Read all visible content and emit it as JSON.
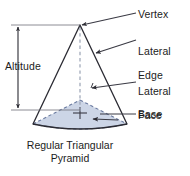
{
  "figure": {
    "caption_line1": "Regular Triangular",
    "caption_line2": "Pyramid",
    "caption_full": "Regular Triangular Pyramid"
  },
  "labels": {
    "vertex": "Vertex",
    "lateral_edge_line1": "Lateral",
    "lateral_edge_line2": "Edge",
    "lateral_face_line1": "Lateral",
    "lateral_face_line2": "Face",
    "base": "Base",
    "altitude": "Altitude"
  },
  "colors": {
    "outline": "#2b2b33",
    "leader": "#3a3a44",
    "base_fill": "#ccd5e6",
    "base_dash": "#6b7ba0",
    "altitude_dash": "#9aa3b5",
    "background": "#ffffff",
    "text": "#1c1c1c"
  },
  "geometry": {
    "apex": [
      80,
      25
    ],
    "base_left": [
      33,
      124
    ],
    "base_right": [
      127,
      124
    ],
    "base_back": [
      80,
      100
    ],
    "base_center": [
      80,
      113
    ],
    "altitude_axis_x": 18,
    "altitude_top_y": 25,
    "altitude_bottom_y": 110
  }
}
